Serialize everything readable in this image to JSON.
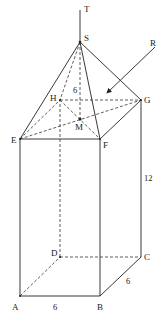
{
  "diagram": {
    "color": "#222222",
    "vertices": {
      "A": {
        "label": "A",
        "x": 20,
        "y": 296
      },
      "B": {
        "label": "B",
        "x": 100,
        "y": 296
      },
      "C": {
        "label": "C",
        "x": 141,
        "y": 257
      },
      "D": {
        "label": "D",
        "x": 60,
        "y": 257
      },
      "E": {
        "label": "E",
        "x": 20,
        "y": 139
      },
      "F": {
        "label": "F",
        "x": 100,
        "y": 139
      },
      "G": {
        "label": "G",
        "x": 141,
        "y": 100
      },
      "H": {
        "label": "H",
        "x": 60,
        "y": 100
      },
      "S": {
        "label": "S",
        "x": 80,
        "y": 42
      },
      "M": {
        "label": "M",
        "x": 80,
        "y": 119
      },
      "T": {
        "label": "T",
        "x": 80,
        "y": 10
      },
      "R": {
        "label": "R",
        "x": 155,
        "y": 47
      }
    },
    "measurements": {
      "AB": "6",
      "BC": "6",
      "CG": "12",
      "SM": "6"
    }
  }
}
